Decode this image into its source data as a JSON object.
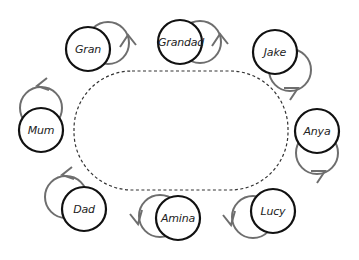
{
  "diagram": {
    "type": "seating-circle",
    "table": {
      "shape": "rounded-rectangle",
      "style": "dashed"
    },
    "seats": [
      {
        "name": "Gran",
        "cx": 88,
        "cy": 49,
        "ghost_dx": 20,
        "ghost_dy": -6,
        "arrow_dir": "right"
      },
      {
        "name": "Grandad",
        "cx": 180,
        "cy": 42,
        "ghost_dx": 20,
        "ghost_dy": 0,
        "arrow_dir": "right"
      },
      {
        "name": "Jake",
        "cx": 275,
        "cy": 52,
        "ghost_dx": 15,
        "ghost_dy": 18,
        "arrow_dir": "down"
      },
      {
        "name": "Anya",
        "cx": 317,
        "cy": 131,
        "ghost_dx": 0,
        "ghost_dy": 22,
        "arrow_dir": "down"
      },
      {
        "name": "Lucy",
        "cx": 273,
        "cy": 211,
        "ghost_dx": -20,
        "ghost_dy": 6,
        "arrow_dir": "left"
      },
      {
        "name": "Amina",
        "cx": 178,
        "cy": 218,
        "ghost_dx": -18,
        "ghost_dy": -2,
        "arrow_dir": "left"
      },
      {
        "name": "Dad",
        "cx": 84,
        "cy": 209,
        "ghost_dx": -18,
        "ghost_dy": -12,
        "arrow_dir": "up"
      },
      {
        "name": "Mum",
        "cx": 41,
        "cy": 130,
        "ghost_dx": 0,
        "ghost_dy": -22,
        "arrow_dir": "up"
      }
    ],
    "colors": {
      "seat_stroke": "#111111",
      "ghost_stroke": "#6e6e6e",
      "table_stroke": "#333333"
    }
  }
}
